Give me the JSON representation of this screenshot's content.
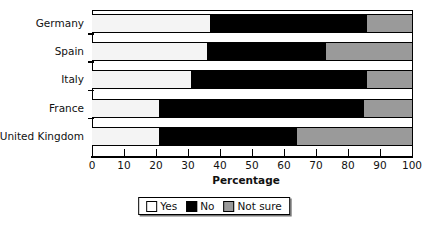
{
  "chart_data": {
    "type": "bar",
    "orientation": "horizontal",
    "stacked": true,
    "title": "",
    "xlabel": "Percentage",
    "ylabel": "",
    "xlim": [
      0,
      100
    ],
    "xticks": [
      0,
      10,
      20,
      30,
      40,
      50,
      60,
      70,
      80,
      90,
      100
    ],
    "grid": false,
    "legend_position": "bottom",
    "categories": [
      "Germany",
      "Spain",
      "Italy",
      "France",
      "United Kingdom"
    ],
    "series": [
      {
        "name": "Yes",
        "color": "#f4f4f4",
        "values": [
          37,
          36,
          31,
          21,
          21
        ]
      },
      {
        "name": "No",
        "color": "#000000",
        "values": [
          49,
          37,
          55,
          64,
          43
        ]
      },
      {
        "name": "Not sure",
        "color": "#9a9a9a",
        "values": [
          14,
          27,
          14,
          15,
          36
        ]
      }
    ],
    "cumulative_boundaries": [
      {
        "category": "Germany",
        "yes_end": 37,
        "no_end": 86
      },
      {
        "category": "Spain",
        "yes_end": 36,
        "no_end": 73
      },
      {
        "category": "Italy",
        "yes_end": 31,
        "no_end": 86
      },
      {
        "category": "France",
        "yes_end": 21,
        "no_end": 85
      },
      {
        "category": "United Kingdom",
        "yes_end": 21,
        "no_end": 64
      }
    ]
  },
  "axis": {
    "x_title": "Percentage",
    "tick_labels": [
      "0",
      "10",
      "20",
      "30",
      "40",
      "50",
      "60",
      "70",
      "80",
      "90",
      "100"
    ]
  },
  "legend": {
    "items": [
      {
        "label": "Yes",
        "swatch": "yes"
      },
      {
        "label": "No",
        "swatch": "no"
      },
      {
        "label": "Not sure",
        "swatch": "notsure"
      }
    ]
  }
}
